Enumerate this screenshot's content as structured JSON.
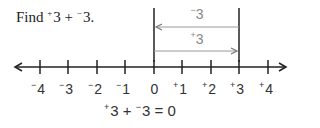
{
  "prompt": {
    "text_before": "Find ",
    "a_sign": "+",
    "a_value": "3",
    "op": " + ",
    "b_sign": "−",
    "b_value": "3",
    "end": "."
  },
  "arrows": [
    {
      "label_sign": "−",
      "label_value": "3",
      "from": 3,
      "to": 0,
      "color": "#999999"
    },
    {
      "label_sign": "+",
      "label_value": "3",
      "from": 0,
      "to": 3,
      "color": "#999999"
    }
  ],
  "number_line": {
    "ticks": [
      {
        "sign": "−",
        "value": "4"
      },
      {
        "sign": "−",
        "value": "3"
      },
      {
        "sign": "−",
        "value": "2"
      },
      {
        "sign": "−",
        "value": "1"
      },
      {
        "sign": "",
        "value": "0"
      },
      {
        "sign": "+",
        "value": "1"
      },
      {
        "sign": "+",
        "value": "2"
      },
      {
        "sign": "+",
        "value": "3"
      },
      {
        "sign": "+",
        "value": "4"
      }
    ]
  },
  "equation": {
    "a_sign": "+",
    "a_value": "3",
    "op": " + ",
    "b_sign": "−",
    "b_value": "3",
    "rest": " = 0"
  }
}
